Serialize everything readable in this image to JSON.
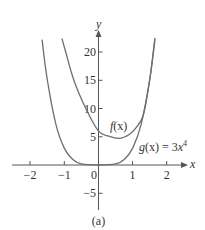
{
  "chart_data": {
    "type": "line",
    "title": "",
    "caption": "(a)",
    "xlabel": "x",
    "ylabel": "y",
    "xlim": [
      -2.4,
      2.4
    ],
    "ylim": [
      -7.5,
      23
    ],
    "x_ticks": [
      -2,
      -1,
      0,
      1,
      2
    ],
    "x_tick_labels": [
      "−2",
      "−1",
      "0",
      "1",
      "2"
    ],
    "y_ticks": [
      -5,
      5,
      10,
      15,
      20
    ],
    "y_tick_labels": [
      "−5",
      "5",
      "10",
      "15",
      "20"
    ],
    "grid": false,
    "legend": "none (inline curve labels)",
    "series": [
      {
        "name": "f(x)",
        "label": "f(x)",
        "description": "Quartic curve with y-intercept about 6, minimum near (0.6, 4.7), merging with g(x) for x > 1.3",
        "points": [
          [
            -1.07,
            22.4
          ],
          [
            -0.96,
            20
          ],
          [
            -0.72,
            15
          ],
          [
            -0.37,
            10
          ],
          [
            0,
            6
          ],
          [
            0.3,
            5.1
          ],
          [
            0.6,
            4.7
          ],
          [
            0.9,
            5.4
          ],
          [
            1.1,
            6.6
          ],
          [
            1.31,
            8.85
          ],
          [
            1.5,
            15.2
          ],
          [
            1.65,
            22.5
          ]
        ]
      },
      {
        "name": "g(x) = 3x^4",
        "label": "g(x) = 3x⁴",
        "points": [
          [
            -1.65,
            22.2
          ],
          [
            -1.5,
            15.2
          ],
          [
            -1.25,
            7.3
          ],
          [
            -1,
            3
          ],
          [
            -0.75,
            0.95
          ],
          [
            -0.5,
            0.19
          ],
          [
            0,
            0
          ],
          [
            0.5,
            0.19
          ],
          [
            0.75,
            0.95
          ],
          [
            1,
            3
          ],
          [
            1.25,
            7.3
          ],
          [
            1.5,
            15.2
          ],
          [
            1.65,
            22.2
          ]
        ]
      }
    ]
  },
  "labels": {
    "x_axis": "x",
    "y_axis": "y",
    "f_label_name": "f",
    "f_label_arg": "(x)",
    "g_label_name": "g",
    "g_label_rest": "(x) = 3",
    "g_label_var": "x",
    "g_label_exp": "4",
    "caption": "(a)",
    "ticks_x": [
      "−2",
      "−1",
      "0",
      "1",
      "2"
    ],
    "ticks_y": [
      "20",
      "15",
      "10",
      "5",
      "−5"
    ]
  },
  "colors": {
    "curve": "#6e6e6e",
    "axis": "#555555",
    "text": "#333333"
  }
}
